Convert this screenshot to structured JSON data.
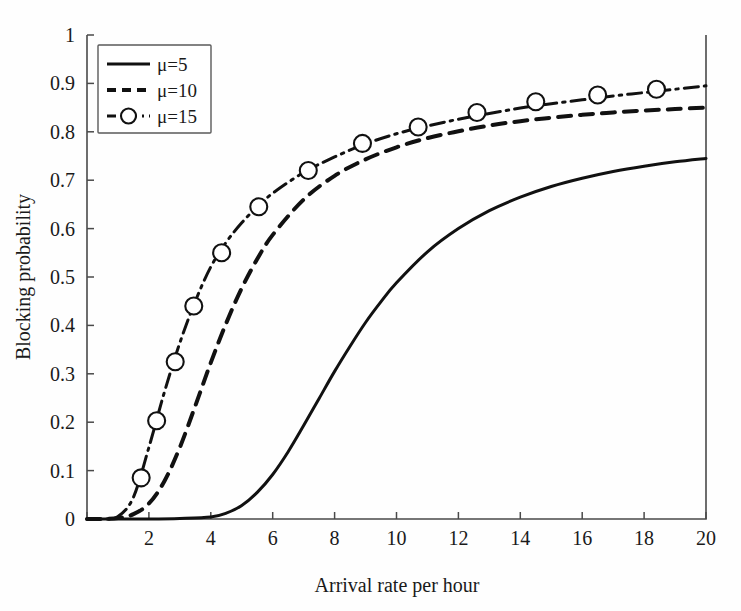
{
  "figure": {
    "background_color": "#fefefe",
    "line_color": "#111111",
    "axis_color": "#4a4a4a"
  },
  "axes": {
    "x_title": "Arrival rate per hour",
    "y_title": "Blocking probability",
    "x_ticks": [
      "0",
      "2",
      "4",
      "6",
      "8",
      "10",
      "12",
      "14",
      "16",
      "18",
      "20"
    ],
    "y_ticks": [
      "0",
      "0.1",
      "0.2",
      "0.3",
      "0.4",
      "0.5",
      "0.6",
      "0.7",
      "0.8",
      "0.9",
      "1"
    ]
  },
  "legend": {
    "entries": [
      {
        "label": "μ=5",
        "style": "solid"
      },
      {
        "label": "μ=10",
        "style": "dashed"
      },
      {
        "label": "μ=15",
        "style": "dash-dot-marker"
      }
    ]
  },
  "chart_data": {
    "type": "line",
    "title": "",
    "xlabel": "Arrival rate per hour",
    "ylabel": "Blocking probability",
    "xlim": [
      0,
      20
    ],
    "ylim": [
      0,
      1
    ],
    "xticks": [
      0,
      2,
      4,
      6,
      8,
      10,
      12,
      14,
      16,
      18,
      20
    ],
    "yticks": [
      0,
      0.1,
      0.2,
      0.3,
      0.4,
      0.5,
      0.6,
      0.7,
      0.8,
      0.9,
      1
    ],
    "grid": false,
    "legend_position": "upper-left",
    "series": [
      {
        "name": "μ=5",
        "style": "solid",
        "marker": "none",
        "x": [
          0,
          1,
          2,
          3,
          4,
          4.5,
          5,
          5.5,
          6,
          6.5,
          7,
          7.5,
          8,
          8.5,
          9,
          9.5,
          10,
          11,
          12,
          13,
          14,
          15,
          16,
          17,
          18,
          19,
          20
        ],
        "y": [
          0,
          0,
          0,
          0.001,
          0.004,
          0.012,
          0.028,
          0.055,
          0.092,
          0.139,
          0.193,
          0.249,
          0.305,
          0.357,
          0.406,
          0.449,
          0.488,
          0.552,
          0.6,
          0.637,
          0.665,
          0.687,
          0.704,
          0.718,
          0.729,
          0.738,
          0.745
        ]
      },
      {
        "name": "μ=10",
        "style": "dashed",
        "marker": "none",
        "x": [
          0,
          0.5,
          1,
          1.5,
          2,
          2.5,
          3,
          3.5,
          4,
          4.5,
          5,
          5.5,
          6,
          7,
          8,
          9,
          10,
          11,
          12,
          13,
          14,
          15,
          16,
          17,
          18,
          19,
          20
        ],
        "y": [
          0,
          0,
          0.002,
          0.01,
          0.032,
          0.078,
          0.148,
          0.234,
          0.323,
          0.405,
          0.477,
          0.537,
          0.587,
          0.66,
          0.709,
          0.743,
          0.768,
          0.787,
          0.801,
          0.813,
          0.822,
          0.829,
          0.835,
          0.84,
          0.844,
          0.847,
          0.85
        ]
      },
      {
        "name": "μ=15",
        "style": "dash-dot",
        "marker": "circle",
        "x": [
          0,
          0.5,
          1,
          1.5,
          2,
          2.5,
          3,
          3.5,
          4,
          4.5,
          5,
          5.5,
          6,
          7,
          8,
          9,
          10,
          11,
          12,
          13,
          14,
          15,
          16,
          17,
          18,
          19,
          20
        ],
        "y": [
          0,
          0,
          0.005,
          0.045,
          0.148,
          0.262,
          0.364,
          0.45,
          0.521,
          0.572,
          0.612,
          0.645,
          0.673,
          0.716,
          0.748,
          0.775,
          0.796,
          0.812,
          0.826,
          0.838,
          0.849,
          0.858,
          0.866,
          0.874,
          0.881,
          0.888,
          0.895
        ],
        "marker_points": [
          {
            "x": 1.75,
            "y": 0.085
          },
          {
            "x": 2.25,
            "y": 0.203
          },
          {
            "x": 2.85,
            "y": 0.325
          },
          {
            "x": 3.45,
            "y": 0.44
          },
          {
            "x": 4.35,
            "y": 0.55
          },
          {
            "x": 5.55,
            "y": 0.645
          },
          {
            "x": 7.15,
            "y": 0.72
          },
          {
            "x": 8.9,
            "y": 0.776
          },
          {
            "x": 10.7,
            "y": 0.81
          },
          {
            "x": 12.6,
            "y": 0.84
          },
          {
            "x": 14.5,
            "y": 0.862
          },
          {
            "x": 16.5,
            "y": 0.876
          },
          {
            "x": 18.4,
            "y": 0.888
          }
        ]
      }
    ]
  }
}
